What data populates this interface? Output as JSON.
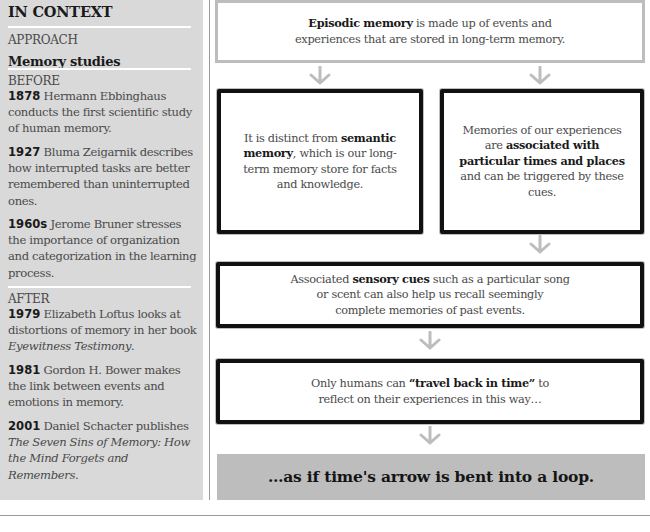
{
  "sidebar": {
    "title": "IN CONTEXT",
    "approach_label": "APPROACH",
    "approach_value": "Memory studies",
    "before_label": "BEFORE",
    "before": [
      {
        "year": "1878",
        "text": " Hermann Ebbinghaus conducts the first scientific study of human memory."
      },
      {
        "year": "1927",
        "text": " Bluma Zeigarnik describes how interrupted tasks are better remembered than uninterrupted ones."
      },
      {
        "year": "1960s",
        "text": " Jerome Bruner stresses the importance of organization and categorization in the learning process."
      }
    ],
    "after_label": "AFTER",
    "after": [
      {
        "year": "1979",
        "text": " Elizabeth Loftus looks at distortions of memory in her book ",
        "italic": "Eyewitness Testimony",
        "tail": "."
      },
      {
        "year": "1981",
        "text": " Gordon H. Bower makes the link between events and emotions in memory."
      },
      {
        "year": "2001",
        "text": " Daniel Schacter publishes ",
        "italic": "The Seven Sins of Memory: How the Mind Forgets and Remembers",
        "tail": "."
      }
    ]
  },
  "flow": {
    "box1": {
      "bold": "Episodic memory",
      "text": " is made up of events and experiences that are stored in long-term memory."
    },
    "box2": {
      "pre": "It is distinct from ",
      "bold": "semantic memory",
      "post": ", which is our long-term memory store for facts and knowledge."
    },
    "box3": {
      "pre": "Memories of our experiences are ",
      "bold": "associated with particular times and places",
      "post": " and can be triggered by these cues."
    },
    "box4": {
      "pre": "Associated ",
      "bold": "sensory cues",
      "post": " such as a particular song or scent can also help us recall seemingly complete memories of past events."
    },
    "box5": {
      "pre": "Only humans can ",
      "bold": "“travel back in time”",
      "post": " to reflect on their experiences in this way…"
    },
    "box6": {
      "text": "…as if time's arrow is bent into a loop."
    }
  },
  "colors": {
    "sidebar_bg": "#d9d9d9",
    "arrow": "#bdbdbd",
    "box_border_gray": "#bdbdbd",
    "box_border_black": "#111111",
    "final_box_fill": "#bdbdbd"
  },
  "icons": {
    "arrow": "arrow-down-icon"
  }
}
